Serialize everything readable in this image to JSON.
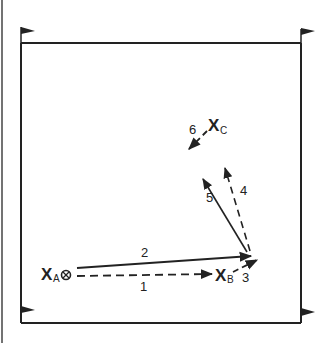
{
  "diagram": {
    "players": {
      "a": {
        "letter": "X",
        "sub": "A"
      },
      "b": {
        "letter": "X",
        "sub": "B"
      },
      "c": {
        "letter": "X",
        "sub": "C"
      }
    },
    "ball_icon": "ball-icon",
    "steps": [
      {
        "id": "1",
        "label": "1",
        "style": "dashed",
        "from": "A",
        "to": "B"
      },
      {
        "id": "2",
        "label": "2",
        "style": "solid",
        "from": "A",
        "to": "near-corner"
      },
      {
        "id": "3",
        "label": "3",
        "style": "dashed",
        "from": "B",
        "to": "near-corner"
      },
      {
        "id": "4",
        "label": "4",
        "style": "dashed",
        "from": "near-corner",
        "to": "C"
      },
      {
        "id": "5",
        "label": "5",
        "style": "solid",
        "from": "near-corner",
        "to": "C-area"
      },
      {
        "id": "6",
        "label": "6",
        "style": "dashed",
        "from": "C",
        "to": "left"
      }
    ],
    "corner_flags": 4,
    "colors": {
      "ink": "#222222",
      "background": "#ffffff"
    }
  }
}
